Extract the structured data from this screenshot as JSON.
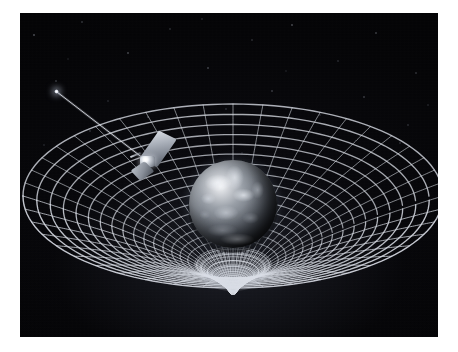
{
  "image": {
    "title": "Gravity Probe B spacetime curvature illustration",
    "subject": "Earth warping the fabric of spacetime",
    "medium": "space art illustration",
    "background_color": "#030305",
    "border_color": "#ffffff",
    "frame": {
      "x": 20,
      "y": 13,
      "width": 418,
      "height": 324
    }
  },
  "elements": {
    "earth": {
      "name": "Earth",
      "center_x": 233,
      "center_y": 204,
      "radius": 44,
      "description": "Cloud-covered Earth globe rendered in desaturated greys, lit from upper left"
    },
    "spacetime_grid": {
      "name": "spacetime grid",
      "description": "Rubber-sheet funnel of glowing white gridlines curving into a deep gravity well beneath Earth",
      "line_color": "#d8dce4",
      "radial_spokes": 44,
      "concentric_rings": 22,
      "rim_center_x": 233,
      "rim_center_y": 196,
      "rim_radius_x": 210,
      "rim_radius_y": 92
    },
    "satellite": {
      "name": "Gravity Probe B satellite",
      "x": 150,
      "y": 158,
      "description": "Spacecraft with angled solar panels and bright central body, orbiting above the grid"
    },
    "guide_star": {
      "name": "guide star IM Pegasi",
      "x": 56,
      "y": 91,
      "description": "Bright point source at upper left"
    },
    "telescope_beam": {
      "name": "telescope sight line",
      "from_x": 57,
      "from_y": 92,
      "to_x": 152,
      "to_y": 165,
      "color": "#e6eaf2",
      "description": "Thin luminous line from the guide star down to the spacecraft telescope"
    },
    "gravity_well": {
      "name": "gravity well throat",
      "center_x": 233,
      "center_y": 278,
      "description": "Tightly packed converging gridlines forming the bottom of the warped funnel"
    }
  }
}
